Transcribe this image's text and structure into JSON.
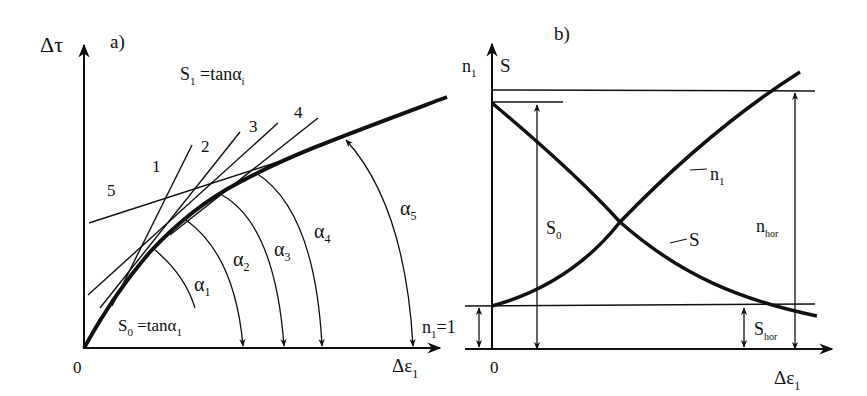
{
  "panel_a": {
    "label": "a)",
    "y_axis": "Δτ",
    "x_axis_main": "Δε",
    "x_axis_sub": "1",
    "origin": "0",
    "top_formula": {
      "main": "S",
      "sub": "1",
      "rest": " =tanα",
      "sub2": "i"
    },
    "bottom_formula": {
      "main": "S",
      "sub": "0",
      "rest": " =tanα",
      "sub2": "1"
    },
    "tangents": [
      "1",
      "2",
      "3",
      "4",
      "5"
    ],
    "angles": [
      {
        "main": "α",
        "sub": "1"
      },
      {
        "main": "α",
        "sub": "2"
      },
      {
        "main": "α",
        "sub": "3"
      },
      {
        "main": "α",
        "sub": "4"
      },
      {
        "main": "α",
        "sub": "5"
      }
    ]
  },
  "panel_b": {
    "label": "b)",
    "y_axis_left": {
      "main": "n",
      "sub": "1"
    },
    "y_axis_right": "S",
    "x_axis_main": "Δε",
    "x_axis_sub": "1",
    "origin": "0",
    "n1_equals_1": {
      "main": "n",
      "sub": "1",
      "rest": "=1"
    },
    "curve_n1": {
      "main": "n",
      "sub": "1"
    },
    "curve_S": "S",
    "S0": {
      "main": "S",
      "sub": "0"
    },
    "n_hor": {
      "main": "n",
      "sub": "hor"
    },
    "S_hor": {
      "main": "S",
      "sub": "hor"
    }
  }
}
